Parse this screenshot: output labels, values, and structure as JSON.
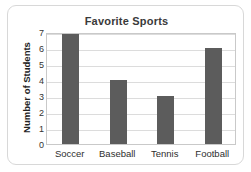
{
  "chart_data": {
    "type": "bar",
    "title": "Favorite Sports",
    "xlabel": "",
    "ylabel": "Number of Students",
    "categories": [
      "Soccer",
      "Baseball",
      "Tennis",
      "Football"
    ],
    "values": [
      7,
      4,
      3,
      6
    ],
    "ylim": [
      0,
      7
    ],
    "ytick_labels": [
      "0",
      "1",
      "2",
      "3",
      "4",
      "5",
      "6",
      "7"
    ],
    "grid": true,
    "legend": false,
    "bar_color": "#5c5c5c",
    "grid_color": "#dcdcdc",
    "axis_color": "#c9c9c9",
    "background": "#ffffff"
  }
}
